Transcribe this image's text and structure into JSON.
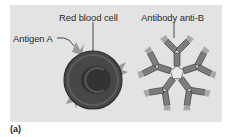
{
  "figure": {
    "panel_label": "(a)",
    "colors": {
      "panel_bg": "#e3e3e3",
      "cell_fill": "#4a4a4a",
      "cell_edge": "#2b2b2b",
      "antigen": "#9a9a9a",
      "antibody": "#7d7d7d",
      "antibody_tip": "#a8a8a8"
    }
  },
  "labels": {
    "red_blood_cell": "Red blood cell",
    "antigen_a": "Antigen A",
    "antibody_anti_b": "Antibody anti-B"
  }
}
